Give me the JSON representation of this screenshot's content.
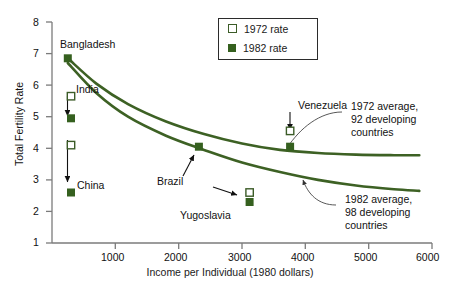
{
  "chart_data": {
    "type": "line",
    "title": "",
    "xlabel": "Income per Individual (1980 dollars)",
    "ylabel": "Total Fertility Rate",
    "xlim": [
      0,
      6000
    ],
    "ylim": [
      1,
      8
    ],
    "xticks": [
      "1000",
      "2000",
      "3000",
      "4000",
      "5000",
      "6000"
    ],
    "xtick_values": [
      1000,
      2000,
      3000,
      4000,
      5000,
      6000
    ],
    "yticks": [
      "1",
      "2",
      "3",
      "4",
      "5",
      "6",
      "7",
      "8"
    ],
    "ytick_values": [
      1,
      2,
      3,
      4,
      5,
      6,
      7,
      8
    ],
    "grid": false,
    "legend_position": "top-center",
    "legend": [
      {
        "key": "rate_1972",
        "label": "1972 rate",
        "marker": "open-square"
      },
      {
        "key": "rate_1982",
        "label": "1982 rate",
        "marker": "filled-square"
      }
    ],
    "series": [
      {
        "name": "1972 average, 92 developing countries",
        "x": [
          250,
          700,
          1200,
          1800,
          2400,
          3000,
          3600,
          4200,
          4800,
          5400,
          5800
        ],
        "values": [
          6.85,
          6.05,
          5.4,
          4.85,
          4.45,
          4.15,
          3.95,
          3.85,
          3.8,
          3.78,
          3.78
        ]
      },
      {
        "name": "1982 average, 98 developing countries",
        "x": [
          250,
          700,
          1200,
          1800,
          2400,
          3000,
          3600,
          4200,
          4800,
          5400,
          5800
        ],
        "values": [
          6.7,
          5.75,
          5.0,
          4.4,
          3.95,
          3.55,
          3.25,
          3.0,
          2.82,
          2.7,
          2.65
        ]
      }
    ],
    "annotations": [
      {
        "name": "avg-1972-note",
        "text": "1972 average,\n92 developing\ncountries"
      },
      {
        "name": "avg-1982-note",
        "text": "1982 average,\n98 developing\ncountries"
      }
    ],
    "countries": [
      {
        "name": "Bangladesh",
        "income": 250,
        "rate_1972": 6.95,
        "rate_1982": 6.85,
        "shows_arrow": false
      },
      {
        "name": "India",
        "income": 300,
        "rate_1972": 5.65,
        "rate_1982": 4.95,
        "shows_arrow": true
      },
      {
        "name": "China",
        "income": 300,
        "rate_1972": 4.1,
        "rate_1982": 2.6,
        "shows_arrow": true
      },
      {
        "name": "Brazil",
        "income": 2320,
        "rate_1972": null,
        "rate_1982": 4.05,
        "shows_arrow": false
      },
      {
        "name": "Yugoslavia",
        "income": 3120,
        "rate_1972": 2.6,
        "rate_1982": 2.3,
        "shows_arrow": true
      },
      {
        "name": "Venezuela",
        "income": 3760,
        "rate_1972": 4.55,
        "rate_1982": 4.05,
        "shows_arrow": true
      }
    ],
    "colors": {
      "curve": "#3d6124",
      "marker_fill": "#35601f",
      "marker_open_edge": "#3c5c28",
      "axis": "#7b7b7b",
      "text": "#111111"
    }
  },
  "labels": {
    "bangladesh": "Bangladesh",
    "india": "India",
    "china": "China",
    "brazil": "Brazil",
    "yugoslavia": "Yugoslavia",
    "venezuela": "Venezuela",
    "note_1972_l1": "1972 average,",
    "note_1972_l2": "92 developing",
    "note_1972_l3": "countries",
    "note_1982_l1": "1982 average,",
    "note_1982_l2": "98 developing",
    "note_1982_l3": "countries"
  },
  "axes": {
    "y_title": "Total Fertility Rate",
    "x_title": "Income per Individual (1980 dollars)",
    "y_8": "8",
    "y_7": "7",
    "y_6": "6",
    "y_5": "5",
    "y_4": "4",
    "y_3": "3",
    "y_2": "2",
    "y_1": "1",
    "x_1000": "1000",
    "x_2000": "2000",
    "x_3000": "3000",
    "x_4000": "4000",
    "x_5000": "5000",
    "x_6000": "6000"
  },
  "legend": {
    "item_1972": "1972 rate",
    "item_1982": "1982 rate"
  }
}
